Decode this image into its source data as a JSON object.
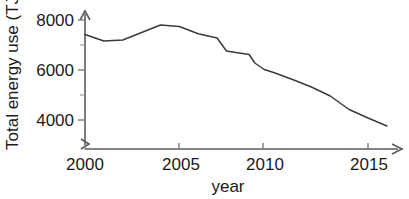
{
  "chart_data": {
    "type": "line",
    "title": "",
    "xlabel": "year",
    "ylabel": "Total energy use (TJ)",
    "xlim": [
      2000,
      2016
    ],
    "ylim": [
      3400,
      8200
    ],
    "grid": false,
    "legend": false,
    "axis_break_y": true,
    "x_ticks": [
      2000,
      2005,
      2010,
      2015
    ],
    "x_tick_labels": [
      "2000",
      "2005",
      "2010",
      "2015"
    ],
    "y_ticks": [
      4000,
      6000,
      8000
    ],
    "y_tick_labels": [
      "4000",
      "6000",
      "8000"
    ],
    "y_minor_ticks": [
      5000,
      7000
    ],
    "series": [
      {
        "name": "Total energy use",
        "x": [
          2000,
          2001,
          2002,
          2003,
          2004,
          2005,
          2006,
          2007,
          2007.5,
          2008,
          2008.7,
          2009,
          2009.5,
          2010,
          2011,
          2012,
          2013,
          2014,
          2015,
          2016
        ],
        "values": [
          7420,
          7160,
          7200,
          7500,
          7800,
          7740,
          7450,
          7280,
          6760,
          6700,
          6620,
          6280,
          6020,
          5900,
          5620,
          5320,
          4960,
          4420,
          4080,
          3760
        ]
      }
    ],
    "axis_labels": {
      "y_axis_title": "Total energy use (TJ)",
      "x_axis_title": "year"
    },
    "colors": {
      "line": "#3a3a3a",
      "axis": "#5a5a5a",
      "text": "#1a1a1a",
      "background": "#ffffff"
    }
  },
  "figure": {
    "y_axis_title": "Total energy use (TJ)",
    "x_axis_title": "year",
    "y_labels": [
      "8000",
      "6000",
      "4000"
    ],
    "x_labels": [
      "2000",
      "2005",
      "2010",
      "2015"
    ]
  }
}
